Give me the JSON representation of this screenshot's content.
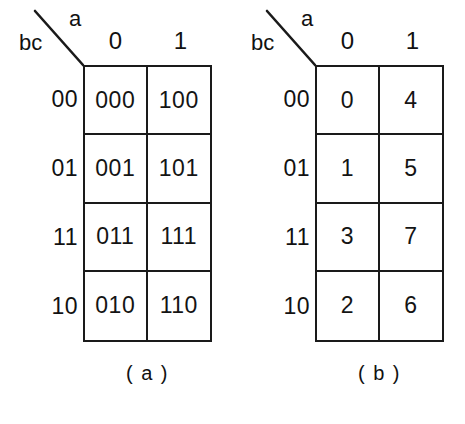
{
  "figure": {
    "maps": [
      {
        "id": "map-a",
        "caption": "( a )",
        "corner": {
          "row_vars_label": "bc",
          "col_var_label": "a",
          "diagonal_icon": "diagonal-divider-line"
        },
        "column_headers": [
          "0",
          "1"
        ],
        "row_headers": [
          "00",
          "01",
          "11",
          "10"
        ],
        "cells": [
          [
            "000",
            "100"
          ],
          [
            "001",
            "101"
          ],
          [
            "011",
            "111"
          ],
          [
            "010",
            "110"
          ]
        ]
      },
      {
        "id": "map-b",
        "caption": "( b )",
        "corner": {
          "row_vars_label": "bc",
          "col_var_label": "a",
          "diagonal_icon": "diagonal-divider-line"
        },
        "column_headers": [
          "0",
          "1"
        ],
        "row_headers": [
          "00",
          "01",
          "11",
          "10"
        ],
        "cells": [
          [
            "0",
            "4"
          ],
          [
            "1",
            "5"
          ],
          [
            "3",
            "7"
          ],
          [
            "2",
            "6"
          ]
        ]
      }
    ]
  },
  "colors": {
    "ink": "#1a1a1a",
    "background": "#ffffff"
  }
}
